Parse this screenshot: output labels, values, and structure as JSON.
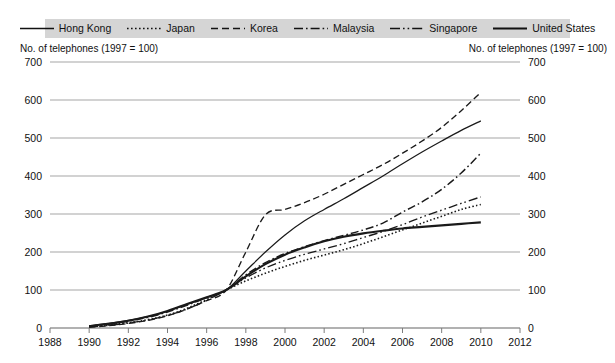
{
  "legend": {
    "items": [
      {
        "label": "Hong Kong",
        "key": "solid-thin",
        "dash": "none"
      },
      {
        "label": "Japan",
        "key": "dotted",
        "dash": "1.6,2.4"
      },
      {
        "label": "Korea",
        "key": "dashed",
        "dash": "7,4"
      },
      {
        "label": "Malaysia",
        "key": "dash-dot",
        "dash": "9,3,1.6,3"
      },
      {
        "label": "Singapore",
        "key": "dash-dot-dot",
        "dash": "10,3,1.6,3,1.6,3"
      },
      {
        "label": "United States",
        "key": "solid-thick",
        "dash": "none"
      }
    ],
    "background_color": "#d5d5d5"
  },
  "axis_caption_left": "No. of telephones (1997 = 100)",
  "axis_caption_right": "No. of telephones (1997 = 100)",
  "chart_data": {
    "type": "line",
    "title": "",
    "xlabel": "",
    "ylabel": "No. of telephones (1997 = 100)",
    "xlim": [
      1988,
      2012
    ],
    "ylim": [
      0,
      700
    ],
    "xticks": [
      "1988",
      "1990",
      "1992",
      "1994",
      "1996",
      "1998",
      "2000",
      "2002",
      "2004",
      "2006",
      "2008",
      "2010",
      "2012"
    ],
    "yticks": [
      "0",
      "100",
      "200",
      "300",
      "400",
      "500",
      "600",
      "700"
    ],
    "grid": true,
    "legend_position": "top",
    "x": [
      1990,
      1991,
      1992,
      1993,
      1994,
      1995,
      1996,
      1997,
      1998,
      1999,
      2000,
      2001,
      2002,
      2003,
      2004,
      2005,
      2006,
      2007,
      2008,
      2009,
      2010
    ],
    "series": [
      {
        "name": "Hong Kong",
        "style": "solid-thin",
        "color": "#1a1a1a",
        "values": [
          6,
          12,
          20,
          30,
          44,
          62,
          80,
          100,
          150,
          200,
          245,
          282,
          312,
          340,
          370,
          400,
          432,
          463,
          492,
          520,
          545
        ]
      },
      {
        "name": "Japan",
        "style": "dotted",
        "color": "#1a1a1a",
        "values": [
          4,
          8,
          14,
          22,
          34,
          52,
          75,
          100,
          124,
          144,
          162,
          178,
          192,
          206,
          222,
          240,
          258,
          276,
          294,
          312,
          325
        ]
      },
      {
        "name": "Korea",
        "style": "dashed",
        "color": "#1a1a1a",
        "values": [
          2,
          6,
          12,
          20,
          32,
          50,
          72,
          100,
          200,
          298,
          312,
          330,
          352,
          378,
          404,
          430,
          460,
          492,
          528,
          572,
          620
        ]
      },
      {
        "name": "Malaysia",
        "style": "dash-dot",
        "color": "#1a1a1a",
        "values": [
          5,
          10,
          18,
          28,
          42,
          60,
          80,
          100,
          140,
          172,
          196,
          214,
          230,
          244,
          258,
          276,
          305,
          332,
          365,
          408,
          460
        ]
      },
      {
        "name": "Singapore",
        "style": "dash-dot-dot",
        "color": "#1a1a1a",
        "values": [
          3,
          7,
          13,
          21,
          33,
          50,
          73,
          100,
          132,
          158,
          178,
          194,
          208,
          222,
          238,
          254,
          272,
          292,
          310,
          328,
          345
        ]
      },
      {
        "name": "United States",
        "style": "solid-thick",
        "color": "#1a1a1a",
        "values": [
          5,
          11,
          19,
          30,
          45,
          63,
          81,
          100,
          136,
          168,
          193,
          212,
          228,
          240,
          249,
          256,
          262,
          266,
          270,
          274,
          278
        ]
      }
    ]
  }
}
